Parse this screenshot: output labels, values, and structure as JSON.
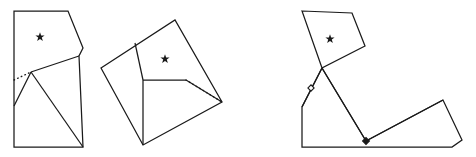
{
  "diagram": {
    "type": "origami-fold-sequence",
    "background_color": "#ffffff",
    "line_color": "#1a1a1a",
    "panel_count": 3,
    "panels": [
      {
        "id": "panel-1",
        "name": "left-panel",
        "label": "",
        "outline_points": "14,11 68,11 83,48 79,56 83,147 14,147",
        "creases": [
          "31,72 79,56",
          "31,72 83,147",
          "31,72 14,106"
        ],
        "dotted_lines": [
          "14,80 31,72"
        ],
        "markers": [
          {
            "kind": "star",
            "name": "star-marker",
            "x": 40,
            "y": 37,
            "size": 4.6
          }
        ]
      },
      {
        "id": "panel-2",
        "name": "middle-panel",
        "label": "",
        "outline_points": "101,68 175,20 222,102 143,145",
        "creases": [
          "135,43 143,80",
          "143,80 143,145",
          "143,80 186,80",
          "186,80 222,102"
        ],
        "dotted_lines": [
          "186,80 222,102"
        ],
        "markers": [
          {
            "kind": "star",
            "name": "star-marker",
            "x": 165,
            "y": 59,
            "size": 4.6
          }
        ]
      },
      {
        "id": "panel-3",
        "name": "right-panel",
        "label": "",
        "outline_points": "302,11 352,13 365,46 322,68 302,107 302,147 452,147 462,140 443,100 366,141 322,68",
        "creases": [
          "322,68 366,141",
          "366,141 443,100",
          "302,107 322,68"
        ],
        "dotted_lines": [],
        "markers": [
          {
            "kind": "star",
            "name": "star-marker",
            "x": 330,
            "y": 39,
            "size": 4.6
          },
          {
            "kind": "hollow-point",
            "name": "hollow-point-marker",
            "x": 311,
            "y": 88,
            "size": 3.1
          },
          {
            "kind": "filled-point",
            "name": "filled-point-marker",
            "x": 366,
            "y": 141,
            "size": 3.1
          }
        ]
      }
    ]
  }
}
